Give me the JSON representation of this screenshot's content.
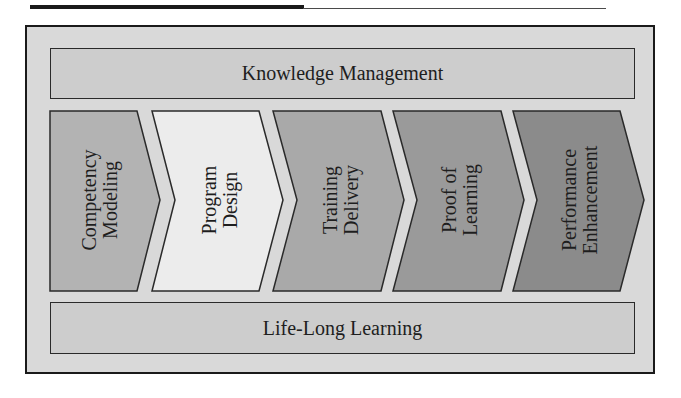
{
  "diagram": {
    "type": "process-chevron-flow",
    "header_rule": true,
    "top_band": {
      "label": "Knowledge Management",
      "color": "#cdcdcd"
    },
    "bottom_band": {
      "label": "Life-Long Learning",
      "color": "#cdcdcd"
    },
    "frame_color": "#d9d9d9",
    "steps": [
      {
        "line1": "Competency",
        "line2": "Modeling",
        "color": "#b3b3b3"
      },
      {
        "line1": "Program",
        "line2": "Design",
        "color": "#ececec"
      },
      {
        "line1": "Training",
        "line2": "Delivery",
        "color": "#a9a9a9"
      },
      {
        "line1": "Proof of",
        "line2": "Learning",
        "color": "#9a9a9a"
      },
      {
        "line1": "Performance",
        "line2": "Enhancement",
        "color": "#8b8b8b"
      }
    ]
  }
}
